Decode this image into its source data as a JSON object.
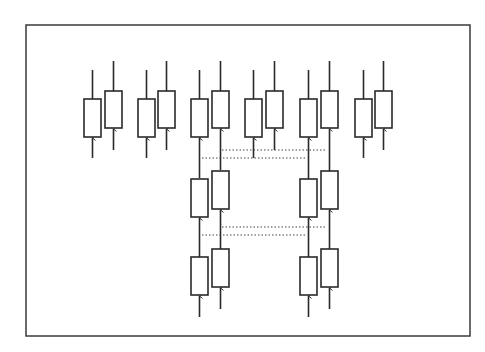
{
  "title_fragment": "",
  "colors": {
    "stroke": "#2a2a2a",
    "frame": "#3a3a3a",
    "dotted": "#444444",
    "fill": "#ffffff"
  },
  "frame": {
    "x": 26,
    "y": 25,
    "w": 444,
    "h": 311
  },
  "blocks": [
    {
      "id": "g1-left",
      "x": 84,
      "y": 99,
      "w": 17,
      "h": 38,
      "stem_top": 70,
      "arrow_bottom": 158
    },
    {
      "id": "g1-right",
      "x": 105,
      "y": 91,
      "w": 17,
      "h": 37,
      "stem_top": 61,
      "arrow_bottom": 150
    },
    {
      "id": "g2-left",
      "x": 138,
      "y": 99,
      "w": 17,
      "h": 38,
      "stem_top": 70,
      "arrow_bottom": 158
    },
    {
      "id": "g2-right",
      "x": 158,
      "y": 91,
      "w": 17,
      "h": 37,
      "stem_top": 61,
      "arrow_bottom": 150
    },
    {
      "id": "g3-left",
      "x": 191,
      "y": 99,
      "w": 17,
      "h": 38,
      "stem_top": 70,
      "arrow_bottom": 178
    },
    {
      "id": "g3-right",
      "x": 212,
      "y": 91,
      "w": 17,
      "h": 37,
      "stem_top": 61,
      "arrow_bottom": 170
    },
    {
      "id": "g4-left",
      "x": 245,
      "y": 99,
      "w": 17,
      "h": 38,
      "stem_top": 70,
      "arrow_bottom": 158
    },
    {
      "id": "g4-right",
      "x": 266,
      "y": 91,
      "w": 17,
      "h": 37,
      "stem_top": 61,
      "arrow_bottom": 150
    },
    {
      "id": "g5-left",
      "x": 300,
      "y": 99,
      "w": 17,
      "h": 38,
      "stem_top": 70,
      "arrow_bottom": 180
    },
    {
      "id": "g5-right",
      "x": 321,
      "y": 91,
      "w": 17,
      "h": 37,
      "stem_top": 61,
      "arrow_bottom": 171
    },
    {
      "id": "g6-left",
      "x": 355,
      "y": 99,
      "w": 17,
      "h": 38,
      "stem_top": 70,
      "arrow_bottom": 158
    },
    {
      "id": "g6-right",
      "x": 375,
      "y": 91,
      "w": 17,
      "h": 37,
      "stem_top": 61,
      "arrow_bottom": 150
    },
    {
      "id": "m1-left",
      "x": 191,
      "y": 179,
      "w": 17,
      "h": 38,
      "stem_top": null,
      "arrow_bottom": 257
    },
    {
      "id": "m1-right",
      "x": 212,
      "y": 171,
      "w": 17,
      "h": 38,
      "stem_top": null,
      "arrow_bottom": 249
    },
    {
      "id": "m2-left",
      "x": 300,
      "y": 179,
      "w": 17,
      "h": 38,
      "stem_top": null,
      "arrow_bottom": 257
    },
    {
      "id": "m2-right",
      "x": 321,
      "y": 171,
      "w": 17,
      "h": 38,
      "stem_top": null,
      "arrow_bottom": 249
    },
    {
      "id": "b1-left",
      "x": 191,
      "y": 257,
      "w": 17,
      "h": 38,
      "stem_top": null,
      "arrow_bottom": 317
    },
    {
      "id": "b1-right",
      "x": 212,
      "y": 249,
      "w": 17,
      "h": 38,
      "stem_top": null,
      "arrow_bottom": 309
    },
    {
      "id": "b2-left",
      "x": 300,
      "y": 257,
      "w": 17,
      "h": 38,
      "stem_top": null,
      "arrow_bottom": 317
    },
    {
      "id": "b2-right",
      "x": 321,
      "y": 249,
      "w": 17,
      "h": 38,
      "stem_top": null,
      "arrow_bottom": 309
    }
  ],
  "dotted_lines": [
    {
      "x1": 222,
      "x2": 325,
      "y": 150
    },
    {
      "x1": 202,
      "x2": 305,
      "y": 158
    },
    {
      "x1": 222,
      "x2": 325,
      "y": 227
    },
    {
      "x1": 202,
      "x2": 305,
      "y": 235
    }
  ]
}
